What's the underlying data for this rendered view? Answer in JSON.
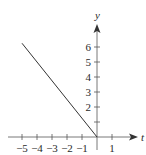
{
  "chart_data": {
    "type": "line",
    "title": "",
    "xlabel": "t",
    "ylabel": "y",
    "xlim": [
      -5.6,
      2.7
    ],
    "ylim": [
      -1.2,
      7.5
    ],
    "grid": false,
    "legend": null,
    "x_ticks": [
      -5,
      -4,
      -3,
      -2,
      -1,
      0,
      1
    ],
    "x_tick_labels": [
      "−5",
      "−4",
      "−3",
      "−2",
      "−1",
      "",
      "1"
    ],
    "y_ticks": [
      1,
      2,
      3,
      4,
      5,
      6
    ],
    "y_tick_labels": [
      "",
      "2",
      "3",
      "4",
      "5",
      "6"
    ],
    "series": [
      {
        "name": "y = -5t/4",
        "x": [
          -5,
          0
        ],
        "y": [
          6.25,
          0
        ],
        "color": "#333333"
      }
    ]
  },
  "colors": {
    "axis": "#555555",
    "line": "#333333",
    "text": "#2a2a2a",
    "background": "#ffffff"
  }
}
